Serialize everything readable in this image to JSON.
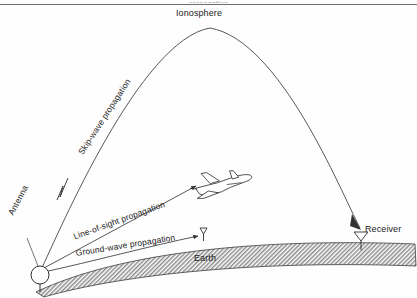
{
  "figure": {
    "title_partial": "propagation",
    "caption_visible": false
  },
  "labels": {
    "ionosphere": "Ionosphere",
    "antenna": "Antenna",
    "receiver": "Receiver",
    "earth": "Earth",
    "skip_wave": "Skip-wave propagation",
    "line_of_sight": "Line-of-sight propagation",
    "ground_wave": "Ground-wave propagation"
  },
  "elements": {
    "ionosphere_arc": "ionospheric-reflection-path",
    "airplane": "airplane-icon",
    "transmit_antenna": "circle-antenna-symbol",
    "receive_antenna": "y-dipole-antenna-symbol",
    "midpoint_antenna": "y-dipole-antenna-symbol",
    "earth_band": "hatched-earth-surface",
    "zigzag": "wave-break-zigzag"
  },
  "colors": {
    "stroke": "#333333",
    "rule": "#6d6d6d",
    "text": "#1c1c1c",
    "hatch": "#8a8a8a",
    "background": "#fefefe"
  }
}
